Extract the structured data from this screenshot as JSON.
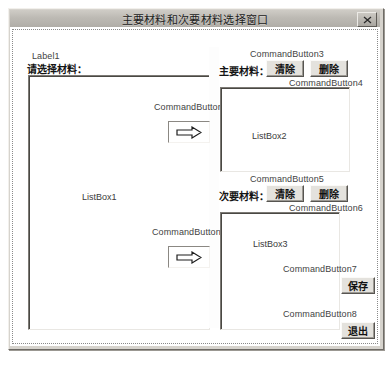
{
  "window": {
    "title": "主要材料和次要材料选择窗口",
    "close_icon": "close-icon"
  },
  "form": {
    "label1": {
      "name": "Label1",
      "text": "请选择材料："
    },
    "listboxes": [
      {
        "id": "listbox1",
        "caption": "ListBox1"
      },
      {
        "id": "listbox2",
        "caption": "ListBox2"
      },
      {
        "id": "listbox3",
        "caption": "ListBox3"
      }
    ],
    "sections": {
      "primary_material_label": "主要材料：",
      "secondary_material_label": "次要材料："
    },
    "command_buttons": [
      {
        "name": "CommandButton1",
        "caption": "",
        "icon": "right-arrow-icon"
      },
      {
        "name": "CommandButton2",
        "caption": "",
        "icon": "right-arrow-icon"
      },
      {
        "name": "CommandButton3",
        "caption": "清除"
      },
      {
        "name": "CommandButton4",
        "caption": "删除"
      },
      {
        "name": "CommandButton5",
        "caption": "清除"
      },
      {
        "name": "CommandButton6",
        "caption": "删除"
      },
      {
        "name": "CommandButton7",
        "caption": "保存"
      },
      {
        "name": "CommandButton8",
        "caption": "退出"
      }
    ]
  },
  "colors": {
    "form_background": "#ffffff",
    "window_chrome": "#d6d3cd",
    "titlebar": "#bdbab4",
    "grid_dot": "#9e9e9e",
    "text": "#141414"
  }
}
